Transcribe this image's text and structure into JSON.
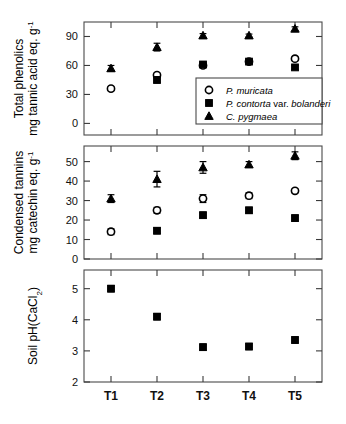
{
  "figure": {
    "x_categories": [
      "T1",
      "T2",
      "T3",
      "T4",
      "T5"
    ],
    "legend": {
      "items": [
        {
          "marker": "open-circle",
          "label": "P. muricata",
          "series_key": "P. muricata"
        },
        {
          "marker": "filled-square",
          "label": "P. contorta var. bolanderi",
          "series_key": "P. contorta var. bolanderi"
        },
        {
          "marker": "filled-triangle",
          "label": "C. pygmaea",
          "series_key": "C. pygmaea"
        }
      ]
    }
  },
  "chart_data": [
    {
      "type": "scatter",
      "panel": "top",
      "title": "",
      "ylabel": "Total phenolics mg tannic acid eq. g",
      "ylabel_line1": "Total phenolics",
      "ylabel_line2": "mg tannic acid eq. g",
      "ylabel_exponent": "-1",
      "xlabel": "",
      "categories": [
        "T1",
        "T2",
        "T3",
        "T4",
        "T5"
      ],
      "yticks": [
        0,
        30,
        60,
        90
      ],
      "ylim": [
        -12,
        105
      ],
      "grid": false,
      "legend_position": "inside-lower-right",
      "series": [
        {
          "name": "P. muricata",
          "marker": "open-circle",
          "values": [
            36,
            50,
            60,
            64,
            67
          ],
          "errors": [
            2,
            2,
            2,
            1.5,
            2
          ]
        },
        {
          "name": "P. contorta var. bolanderi",
          "marker": "filled-square",
          "values": [
            null,
            45,
            61,
            64,
            58
          ],
          "errors": [
            null,
            3,
            2.5,
            2,
            2
          ]
        },
        {
          "name": "C. pygmaea",
          "marker": "filled-triangle",
          "values": [
            57,
            79,
            91,
            91,
            98
          ],
          "errors": [
            3,
            4,
            2,
            1.5,
            2
          ]
        }
      ]
    },
    {
      "type": "scatter",
      "panel": "middle",
      "title": "",
      "ylabel": "Condensed tannins mg catechin eq. g",
      "ylabel_line1": "Condensed tannins",
      "ylabel_line2": "mg catechin eq. g",
      "ylabel_exponent": "-1",
      "xlabel": "",
      "categories": [
        "T1",
        "T2",
        "T3",
        "T4",
        "T5"
      ],
      "yticks": [
        0,
        10,
        20,
        30,
        40,
        50
      ],
      "ylim": [
        0,
        58
      ],
      "grid": false,
      "legend_position": "none",
      "series": [
        {
          "name": "P. muricata",
          "marker": "open-circle",
          "values": [
            14,
            25,
            31,
            32.5,
            35
          ],
          "errors": [
            1.5,
            1.5,
            2,
            1.5,
            1
          ]
        },
        {
          "name": "P. contorta var. bolanderi",
          "marker": "filled-square",
          "values": [
            null,
            14.5,
            22.5,
            25,
            21
          ],
          "errors": [
            null,
            1.5,
            1.5,
            1.5,
            1.5
          ]
        },
        {
          "name": "C. pygmaea",
          "marker": "filled-triangle",
          "values": [
            31,
            41,
            47,
            48.5,
            53
          ],
          "errors": [
            2,
            4,
            3,
            1.5,
            2
          ]
        }
      ]
    },
    {
      "type": "scatter",
      "panel": "bottom",
      "title": "",
      "ylabel": "Soil pH(CaCl",
      "ylabel_line1": "Soil pH(CaCl",
      "ylabel_subscript": "2",
      "ylabel_suffix": ")",
      "xlabel": "",
      "categories": [
        "T1",
        "T2",
        "T3",
        "T4",
        "T5"
      ],
      "yticks": [
        2,
        3,
        4,
        5
      ],
      "ylim": [
        2,
        5.6
      ],
      "grid": false,
      "legend_position": "none",
      "series": [
        {
          "name": "Soil pH",
          "marker": "filled-square",
          "values": [
            5.0,
            4.1,
            3.12,
            3.14,
            3.35
          ],
          "errors": [
            0.1,
            0.1,
            0.1,
            0.1,
            0.1
          ]
        }
      ]
    }
  ]
}
